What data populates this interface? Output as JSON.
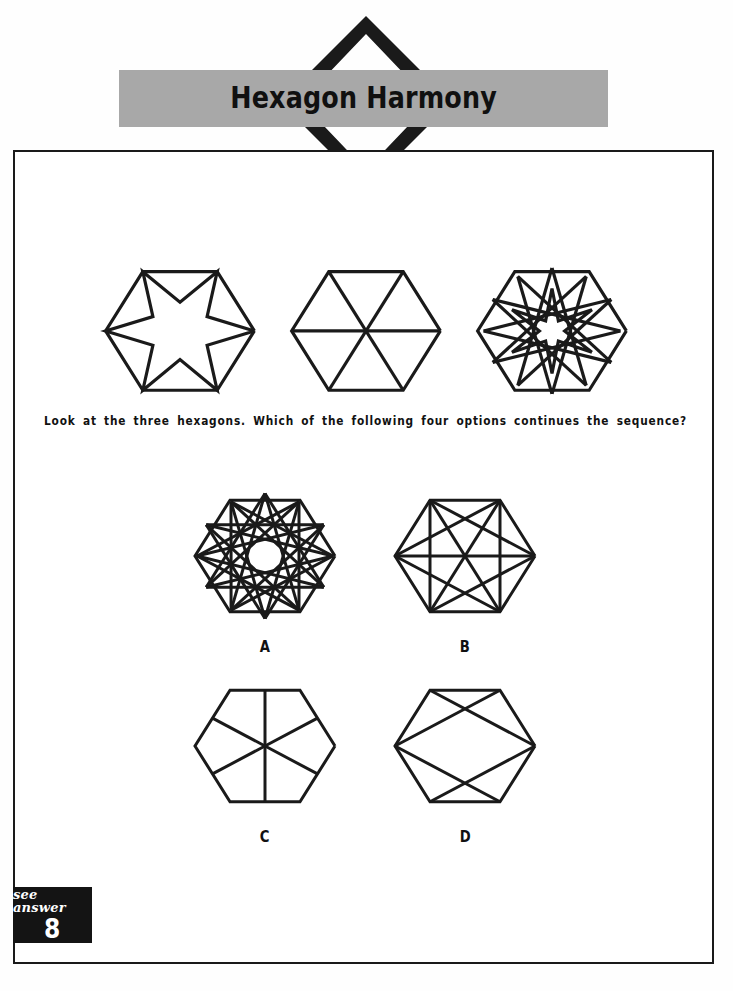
{
  "header": {
    "title": "Hexagon Harmony",
    "banner_color": "#a8a8a8",
    "chevron_color": "#1a1a1a"
  },
  "question": {
    "text": "Look at the three hexagons. Which of the following four options continues the sequence?"
  },
  "sequence": [
    {
      "id": "sequence-hexagon-1",
      "pattern": "six-point-star",
      "description": "Hexagon containing a six-pointed star whose points touch the hexagon vertices"
    },
    {
      "id": "sequence-hexagon-2",
      "pattern": "three-main-diagonals",
      "description": "Hexagon divided into six triangles by three long diagonals"
    },
    {
      "id": "sequence-hexagon-3",
      "pattern": "twelve-point-star",
      "description": "Hexagon containing a dense twelve-pointed star with an open centre"
    }
  ],
  "options": [
    {
      "label": "A",
      "id": "option-a",
      "pattern": "twelve-point-star-dense",
      "description": "Hexagon with a dense twelve-pointed star and a round open centre"
    },
    {
      "label": "B",
      "id": "option-b",
      "pattern": "all-chords-lattice",
      "description": "Hexagon with many crossing chords forming a lattice"
    },
    {
      "label": "C",
      "id": "option-c",
      "pattern": "six-spokes-midpoints",
      "description": "Hexagon with six spokes from the centre to the edge midpoints"
    },
    {
      "label": "D",
      "id": "option-d",
      "pattern": "two-crossed-triangles",
      "description": "Hexagon with two crossing chord pairs forming a diamond"
    }
  ],
  "answer_badge": {
    "caption": "see answer",
    "number": "8",
    "background": "#141414"
  },
  "style": {
    "ink": "#1a1a1a",
    "paper": "#ffffff",
    "stroke_width": 3
  }
}
